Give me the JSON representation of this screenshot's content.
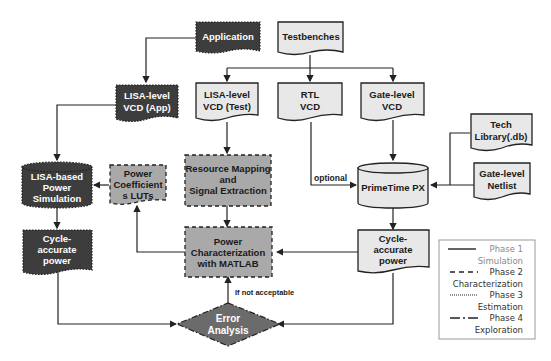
{
  "nodes": {
    "application": {
      "label": "Application"
    },
    "testbenches": {
      "label": "Testbenches"
    },
    "lisa_vcd_app": {
      "line1": "LISA-level",
      "line2": "VCD (App)"
    },
    "lisa_vcd_test": {
      "line1": "LISA-level",
      "line2": "VCD (Test)"
    },
    "rtl_vcd": {
      "line1": "RTL",
      "line2": "VCD"
    },
    "gate_vcd": {
      "line1": "Gate-level",
      "line2": "VCD"
    },
    "tech_library": {
      "line1": "Tech",
      "line2": "Library(.db)"
    },
    "gate_netlist": {
      "line1": "Gate-level",
      "line2": "Netlist"
    },
    "primetime": {
      "label": "PrimeTime PX"
    },
    "lisa_power_sim": {
      "line1": "LISA-based",
      "line2": "Power",
      "line3": "Simulation"
    },
    "power_luts": {
      "line1": "Power",
      "line2": "Coefficient",
      "line3": "s LUTs"
    },
    "resource_mapping": {
      "line1": "Resource Mapping",
      "line2": "and",
      "line3": "Signal Extraction"
    },
    "power_char": {
      "line1": "Power",
      "line2": "Characterization",
      "line3": "with MATLAB"
    },
    "cycle_power_left": {
      "line1": "Cycle-",
      "line2": "accurate",
      "line3": "power"
    },
    "cycle_power_right": {
      "line1": "Cycle-",
      "line2": "accurate",
      "line3": "power"
    },
    "error_analysis": {
      "line1": "Error",
      "line2": "Analysis"
    }
  },
  "edge_labels": {
    "optional": "optional",
    "if_not_acceptable": "If not acceptable"
  },
  "legend": {
    "items": [
      {
        "style": "solid",
        "phase": "Phase 1",
        "name": "Simulation"
      },
      {
        "style": "dashed",
        "phase": "Phase 2",
        "name": "Characterization"
      },
      {
        "style": "dotted",
        "phase": "Phase 3",
        "name": "Estimation"
      },
      {
        "style": "dash-dot",
        "phase": "Phase 4",
        "name": "Exploration"
      }
    ]
  },
  "colors": {
    "dark_fill": "#3d3d3d",
    "mid_fill": "#a9a9a9",
    "light_fill": "#e8e8e8",
    "stroke": "#222222"
  }
}
